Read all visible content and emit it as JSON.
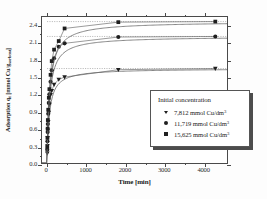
{
  "chart_data": {
    "type": "scatter",
    "title": "",
    "xlabel": "Time [min]",
    "ylabel": "Adsorption q, [mmol Cu/g sorbent]",
    "ylabel_main": "Adsorption q",
    "ylabel_sub": "t",
    "ylabel_unit": " [mmol Cu/g",
    "ylabel_unit_sub": "sorbent",
    "ylabel_unit_end": "]",
    "xlim": [
      -130,
      4620
    ],
    "ylim": [
      0.0,
      2.55
    ],
    "grid": false,
    "legend_position": "lower-right-inside",
    "xticks": [
      0,
      1000,
      2000,
      3000,
      4000
    ],
    "xtick_labels": [
      "0",
      "1000",
      "2000",
      "3000",
      "4000"
    ],
    "xticks_minor": [
      500,
      1500,
      2500,
      3500
    ],
    "yticks": [
      0.0,
      0.3,
      0.6,
      0.9,
      1.2,
      1.5,
      1.8,
      2.1,
      2.4
    ],
    "ytick_labels": [
      "0.0",
      "0.3",
      "0.6",
      "0.9",
      "1.2",
      "1.5",
      "1.8",
      "2.1",
      "2.4"
    ],
    "yticks_minor": [
      0.15,
      0.45,
      0.75,
      1.05,
      1.35,
      1.65,
      1.95,
      2.25
    ],
    "marker_color": "#1f1f1f",
    "fit_line_color": "#6e6e6e",
    "dotted_line_color": "#9a9a9a",
    "series": [
      {
        "name": "7,812 mmol Cu/dm3",
        "label": "7,812 mmol Cu/dm",
        "label_sup": "3",
        "marker": "triangle-down",
        "plateau": 1.65,
        "x": [
          5,
          10,
          15,
          20,
          30,
          45,
          60,
          90,
          120,
          180,
          300,
          450,
          1830,
          4320
        ],
        "y": [
          0.17,
          0.3,
          0.44,
          0.57,
          0.72,
          0.88,
          1.02,
          1.19,
          1.26,
          1.37,
          1.46,
          1.5,
          1.63,
          1.65
        ]
      },
      {
        "name": "11,719 mmol Cu/dm3",
        "label": "11,719 mmol Cu/dm",
        "label_sup": "3",
        "marker": "circle",
        "plateau": 2.21,
        "x": [
          5,
          10,
          15,
          20,
          30,
          45,
          60,
          90,
          120,
          180,
          300,
          450,
          1830,
          4320
        ],
        "y": [
          0.23,
          0.38,
          0.54,
          0.68,
          0.86,
          1.05,
          1.2,
          1.42,
          1.62,
          1.83,
          2.03,
          2.09,
          2.2,
          2.21
        ]
      },
      {
        "name": "15,625 mmol Cu/dm3",
        "label": "15,625 mmol Cu/dm",
        "label_sup": "3",
        "marker": "square",
        "plateau": 2.47,
        "x": [
          5,
          10,
          15,
          20,
          30,
          45,
          60,
          90,
          120,
          180,
          300,
          450,
          1830,
          4320
        ],
        "y": [
          0.28,
          0.44,
          0.6,
          0.75,
          0.93,
          1.14,
          1.29,
          1.54,
          1.78,
          1.98,
          2.13,
          2.35,
          2.46,
          2.47
        ]
      }
    ]
  },
  "legend": {
    "title": "Initial concentration",
    "entries": [
      {
        "marker": "triangle-down",
        "text": "7,812 mmol Cu/dm",
        "sup": "3"
      },
      {
        "marker": "circle",
        "text": "11,719 mmol Cu/dm",
        "sup": "3"
      },
      {
        "marker": "square",
        "text": "15,625 mmol Cu/dm",
        "sup": "3"
      }
    ]
  }
}
